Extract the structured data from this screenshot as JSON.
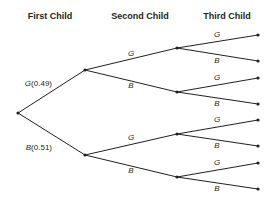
{
  "headers": {
    "first": "First Child",
    "second": "Second Child",
    "third": "Third Child"
  },
  "tree": {
    "first_level": [
      {
        "outcome": "G",
        "probability": "(0.49)"
      },
      {
        "outcome": "B",
        "probability": "(0.51)"
      }
    ],
    "second_level": [
      {
        "outcome": "G"
      },
      {
        "outcome": "B"
      },
      {
        "outcome": "G"
      },
      {
        "outcome": "B"
      }
    ],
    "third_level": [
      {
        "outcome": "G"
      },
      {
        "outcome": "B"
      },
      {
        "outcome": "G"
      },
      {
        "outcome": "B"
      },
      {
        "outcome": "G"
      },
      {
        "outcome": "B"
      },
      {
        "outcome": "G"
      },
      {
        "outcome": "B"
      }
    ]
  }
}
